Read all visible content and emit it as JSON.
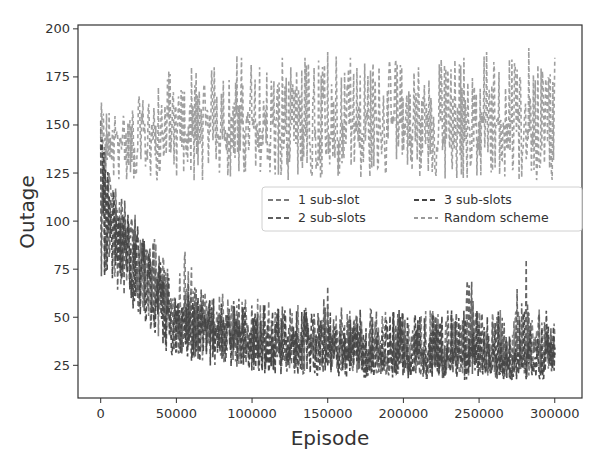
{
  "chart_data": {
    "type": "line",
    "title": "",
    "xlabel": "Episode",
    "ylabel": "Outage",
    "xlim": [
      -15000,
      318000
    ],
    "ylim": [
      8,
      202
    ],
    "grid": false,
    "legend_position": "center-right",
    "legend_columns": 2,
    "x_ticks": [
      0,
      50000,
      100000,
      150000,
      200000,
      250000,
      300000
    ],
    "x_tick_labels": [
      "0",
      "50000",
      "100000",
      "150000",
      "200000",
      "250000",
      "300000"
    ],
    "y_ticks": [
      25,
      50,
      75,
      100,
      125,
      150,
      175,
      200
    ],
    "y_tick_labels": [
      "25",
      "50",
      "75",
      "100",
      "125",
      "150",
      "175",
      "200"
    ],
    "x": [
      0,
      5000,
      10000,
      15000,
      20000,
      25000,
      30000,
      35000,
      40000,
      45000,
      50000,
      55000,
      60000,
      65000,
      70000,
      75000,
      80000,
      85000,
      90000,
      95000,
      100000,
      105000,
      110000,
      115000,
      120000,
      125000,
      130000,
      135000,
      140000,
      145000,
      150000,
      155000,
      160000,
      165000,
      170000,
      175000,
      180000,
      185000,
      190000,
      195000,
      200000,
      205000,
      210000,
      215000,
      220000,
      225000,
      230000,
      235000,
      240000,
      245000,
      250000,
      255000,
      260000,
      265000,
      270000,
      275000,
      280000,
      285000,
      290000,
      295000,
      300000
    ],
    "series": [
      {
        "name": "1 sub-slot",
        "color": "#7a7a7a",
        "dash": "5,3",
        "values": [
          140,
          112,
          105,
          98,
          92,
          88,
          80,
          72,
          65,
          58,
          55,
          52,
          50,
          48,
          47,
          45,
          44,
          43,
          42,
          41,
          40,
          40,
          39,
          38,
          38,
          37,
          37,
          36,
          36,
          35,
          35,
          35,
          34,
          34,
          34,
          33,
          33,
          33,
          33,
          32,
          32,
          32,
          32,
          32,
          31,
          31,
          31,
          31,
          31,
          30,
          30,
          30,
          30,
          30,
          30,
          30,
          30,
          30,
          30,
          30,
          30
        ],
        "min": [
          62,
          70,
          62,
          58,
          55,
          50,
          45,
          40,
          35,
          32,
          28,
          26,
          25,
          24,
          24,
          23,
          23,
          22,
          22,
          22,
          21,
          21,
          21,
          20,
          20,
          20,
          20,
          20,
          20,
          20,
          19,
          19,
          19,
          19,
          19,
          19,
          19,
          19,
          19,
          19,
          18,
          18,
          18,
          18,
          18,
          18,
          18,
          18,
          18,
          18,
          18,
          18,
          18,
          18,
          18,
          18,
          18,
          18,
          18,
          18,
          18
        ],
        "max": [
          160,
          128,
          122,
          118,
          110,
          104,
          98,
          92,
          84,
          76,
          70,
          90,
          76,
          68,
          66,
          64,
          63,
          62,
          61,
          60,
          60,
          60,
          59,
          58,
          58,
          58,
          57,
          57,
          57,
          56,
          56,
          56,
          55,
          55,
          55,
          55,
          55,
          55,
          54,
          54,
          54,
          54,
          54,
          54,
          54,
          54,
          54,
          54,
          54,
          54,
          54,
          54,
          54,
          54,
          54,
          54,
          54,
          54,
          54,
          54,
          54
        ]
      },
      {
        "name": "2 sub-slots",
        "color": "#5e5e5e",
        "dash": "5,3",
        "values": [
          140,
          110,
          103,
          96,
          90,
          86,
          78,
          70,
          62,
          56,
          52,
          50,
          48,
          46,
          45,
          44,
          43,
          42,
          41,
          40,
          39,
          39,
          38,
          37,
          37,
          36,
          36,
          35,
          35,
          34,
          34,
          34,
          33,
          33,
          33,
          32,
          32,
          32,
          32,
          31,
          31,
          31,
          31,
          31,
          30,
          30,
          30,
          30,
          30,
          30,
          30,
          30,
          30,
          30,
          30,
          30,
          30,
          30,
          30,
          30,
          30
        ],
        "min": [
          62,
          68,
          60,
          56,
          52,
          48,
          42,
          38,
          34,
          30,
          27,
          25,
          24,
          23,
          23,
          22,
          22,
          21,
          21,
          21,
          20,
          20,
          20,
          19,
          19,
          19,
          19,
          19,
          19,
          19,
          18,
          18,
          18,
          18,
          18,
          18,
          18,
          18,
          18,
          18,
          17,
          17,
          17,
          17,
          17,
          17,
          17,
          17,
          17,
          17,
          17,
          17,
          17,
          17,
          17,
          17,
          17,
          17,
          17,
          17,
          17
        ],
        "max": [
          158,
          126,
          120,
          116,
          108,
          102,
          96,
          90,
          82,
          74,
          68,
          66,
          70,
          66,
          64,
          62,
          61,
          60,
          60,
          59,
          59,
          58,
          58,
          57,
          57,
          57,
          56,
          56,
          56,
          56,
          66,
          56,
          55,
          55,
          55,
          55,
          55,
          55,
          54,
          54,
          54,
          54,
          54,
          54,
          54,
          54,
          54,
          54,
          54,
          97,
          54,
          54,
          54,
          54,
          54,
          64,
          88,
          54,
          54,
          54,
          54
        ]
      },
      {
        "name": "3 sub-slots",
        "color": "#444444",
        "dash": "5,3",
        "values": [
          140,
          108,
          101,
          94,
          88,
          84,
          76,
          68,
          60,
          54,
          50,
          48,
          46,
          45,
          44,
          43,
          42,
          41,
          40,
          39,
          38,
          38,
          37,
          36,
          36,
          35,
          35,
          34,
          34,
          33,
          33,
          33,
          32,
          32,
          32,
          31,
          31,
          31,
          31,
          30,
          30,
          30,
          30,
          30,
          29,
          29,
          29,
          29,
          29,
          29,
          29,
          29,
          29,
          29,
          29,
          29,
          29,
          29,
          29,
          29,
          29
        ],
        "min": [
          62,
          66,
          58,
          54,
          50,
          46,
          40,
          36,
          32,
          28,
          26,
          24,
          23,
          22,
          22,
          21,
          21,
          20,
          20,
          20,
          19,
          19,
          19,
          18,
          18,
          18,
          18,
          18,
          18,
          18,
          17,
          17,
          17,
          17,
          17,
          17,
          17,
          17,
          17,
          17,
          16,
          16,
          16,
          16,
          16,
          16,
          16,
          16,
          16,
          16,
          16,
          16,
          16,
          16,
          16,
          16,
          16,
          16,
          16,
          16,
          16
        ],
        "max": [
          156,
          124,
          118,
          114,
          106,
          100,
          94,
          88,
          80,
          72,
          66,
          64,
          62,
          62,
          60,
          60,
          59,
          58,
          58,
          57,
          57,
          56,
          56,
          56,
          55,
          55,
          55,
          55,
          54,
          54,
          54,
          54,
          54,
          54,
          54,
          54,
          54,
          54,
          54,
          54,
          54,
          54,
          54,
          54,
          54,
          54,
          54,
          54,
          54,
          54,
          54,
          54,
          54,
          54,
          54,
          54,
          54,
          54,
          54,
          54,
          54
        ]
      },
      {
        "name": "Random scheme",
        "color": "#9a9a9a",
        "dash": "4,3",
        "values": [
          140,
          142,
          143,
          144,
          144,
          145,
          145,
          146,
          146,
          146,
          147,
          147,
          147,
          147,
          148,
          148,
          148,
          148,
          148,
          149,
          149,
          149,
          149,
          149,
          149,
          150,
          150,
          150,
          150,
          150,
          150,
          150,
          150,
          150,
          150,
          150,
          150,
          150,
          150,
          150,
          150,
          151,
          151,
          151,
          151,
          151,
          151,
          151,
          151,
          151,
          151,
          151,
          151,
          151,
          151,
          151,
          151,
          151,
          151,
          151,
          151
        ],
        "min": [
          120,
          118,
          118,
          118,
          118,
          118,
          118,
          118,
          118,
          118,
          118,
          118,
          118,
          118,
          118,
          118,
          118,
          118,
          118,
          118,
          118,
          118,
          118,
          118,
          118,
          118,
          118,
          118,
          118,
          118,
          118,
          118,
          118,
          118,
          118,
          118,
          118,
          118,
          118,
          118,
          118,
          118,
          118,
          118,
          118,
          118,
          118,
          118,
          118,
          118,
          118,
          118,
          118,
          118,
          118,
          118,
          118,
          118,
          118,
          118,
          118
        ],
        "max": [
          162,
          160,
          158,
          158,
          160,
          165,
          166,
          168,
          172,
          178,
          176,
          178,
          180,
          182,
          178,
          180,
          182,
          184,
          186,
          188,
          185,
          180,
          182,
          184,
          185,
          182,
          180,
          185,
          186,
          187,
          188,
          190,
          186,
          185,
          184,
          183,
          182,
          185,
          186,
          184,
          183,
          182,
          180,
          181,
          182,
          184,
          185,
          186,
          185,
          184,
          186,
          188,
          188,
          186,
          184,
          187,
          192,
          193,
          188,
          186,
          185
        ]
      }
    ]
  }
}
